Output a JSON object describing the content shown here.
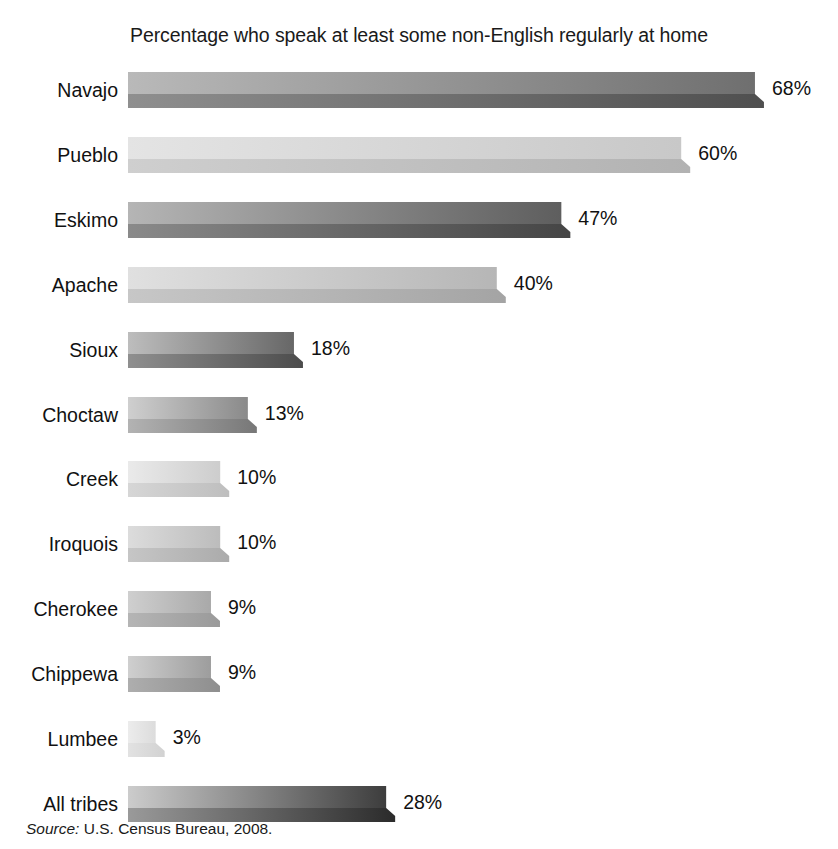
{
  "chart_data": {
    "type": "bar",
    "orientation": "horizontal",
    "title": "Percentage who speak at least some non-English regularly at home",
    "xlabel": "",
    "ylabel": "",
    "xlim": [
      0,
      70
    ],
    "grid": false,
    "legend": null,
    "value_suffix": "%",
    "categories": [
      "Navajo",
      "Pueblo",
      "Eskimo",
      "Apache",
      "Sioux",
      "Choctaw",
      "Creek",
      "Iroquois",
      "Cherokee",
      "Chippewa",
      "Lumbee",
      "All tribes"
    ],
    "values": [
      68,
      60,
      47,
      40,
      18,
      13,
      10,
      10,
      9,
      9,
      3,
      28
    ],
    "value_labels": [
      "68%",
      "60%",
      "47%",
      "40%",
      "18%",
      "13%",
      "10%",
      "10%",
      "9%",
      "9%",
      "3%",
      "28%"
    ],
    "bar_colors_top_start": [
      "#b9b9b9",
      "#e4e4e4",
      "#b5b5b5",
      "#e0e0e0",
      "#bdbdbd",
      "#cfcfcf",
      "#eaeaea",
      "#dcdcdc",
      "#cfcfcf",
      "#cfcfcf",
      "#ececec",
      "#cccccc"
    ],
    "bar_colors_top_end": [
      "#6f6f6f",
      "#c8c8c8",
      "#5e5e5e",
      "#b6b6b6",
      "#676767",
      "#8a8a8a",
      "#cdcdcd",
      "#bcbcbc",
      "#a9a9a9",
      "#9d9d9d",
      "#dcdcdc",
      "#3d3d3d"
    ],
    "bar_colors_side_start": [
      "#8f8f8f",
      "#cfcfcf",
      "#8a8a8a",
      "#c7c7c7",
      "#8f8f8f",
      "#b3b3b3",
      "#d6d6d6",
      "#c6c6c6",
      "#b5b5b5",
      "#aeaeae",
      "#e2e2e2",
      "#9a9a9a"
    ],
    "bar_colors_side_end": [
      "#4f4f4f",
      "#b2b2b2",
      "#454545",
      "#a4a4a4",
      "#4c4c4c",
      "#777777",
      "#bebebe",
      "#ababab",
      "#9a9a9a",
      "#8e8e8e",
      "#d2d2d2",
      "#2b2b2b"
    ]
  },
  "source": {
    "keyword": "Source:",
    "text": " U.S. Census Bureau, 2008."
  }
}
